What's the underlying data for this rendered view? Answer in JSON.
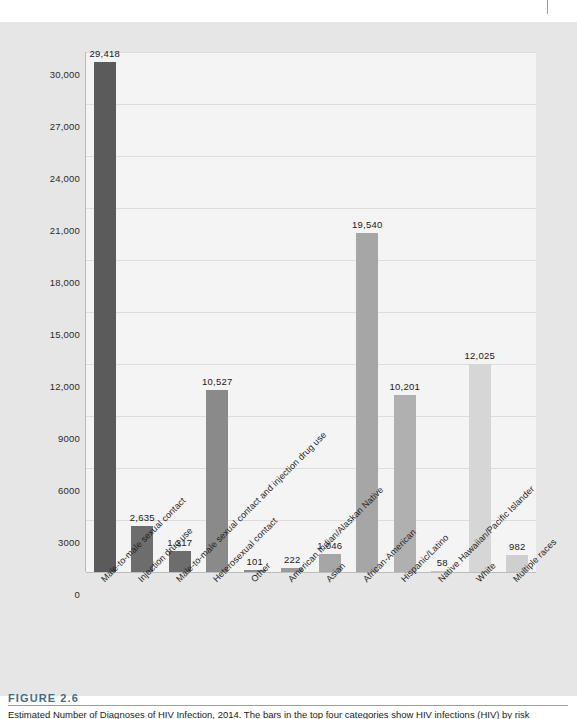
{
  "figure": {
    "number_label": "FIGURE 2.6",
    "caption": "Estimated Number of Diagnoses of HIV Infection, 2014. The bars in the top four categories show HIV infections (HIV) by risk"
  },
  "chart_data": {
    "type": "bar",
    "title": "",
    "xlabel": "",
    "ylabel": "Number of New HIV Infections",
    "ylim": [
      0,
      30000
    ],
    "ytick_labels": [
      "30,000",
      "27,000",
      "24,000",
      "21,000",
      "18,000",
      "15,000",
      "12,000",
      "9000",
      "6000",
      "3000",
      "0"
    ],
    "ytick_values": [
      30000,
      27000,
      24000,
      21000,
      18000,
      15000,
      12000,
      9000,
      6000,
      3000,
      0
    ],
    "grid": true,
    "legend": "none",
    "categories": [
      "Male-to-male sexual contact",
      "Injection drug use",
      "Male-to-male sexual contact and injection drug use",
      "Heterosexual contact",
      "Other",
      "American Indian/Alaskan Native",
      "Asian",
      "African-American",
      "Hispanic/Latino",
      "Native Hawaiian/Pacific Islander",
      "White",
      "Multiple races"
    ],
    "values": [
      29418,
      2635,
      1217,
      10527,
      101,
      222,
      1046,
      19540,
      10201,
      58,
      12025,
      982
    ],
    "value_labels": [
      "29,418",
      "2,635",
      "1,217",
      "10,527",
      "101",
      "222",
      "1,046",
      "19,540",
      "10,201",
      "58",
      "12,025",
      "982"
    ],
    "bar_colors": [
      "#5b5b5b",
      "#6d6d6d",
      "#6d6d6d",
      "#8a8a8a",
      "#8a8a8a",
      "#9a9a9a",
      "#a6a6a6",
      "#a6a6a6",
      "#b0b0b0",
      "#c4c4c4",
      "#d6d6d6",
      "#cfcfcf"
    ]
  },
  "colors": {
    "page_background": "#ffffff",
    "panel_background": "#e6e6e6",
    "plot_background": "#f4f4f4",
    "gridline": "#dcdcdc",
    "axis": "#b9b9b9",
    "caption_accent": "#3c6e86",
    "text": "#1f1f1f"
  }
}
